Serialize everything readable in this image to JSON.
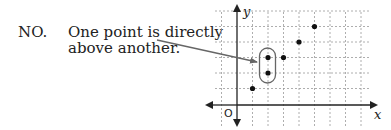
{
  "caption": {
    "label": "NO.",
    "line1": "One point is directly",
    "line2": "above another."
  },
  "axes": {
    "x_label": "x",
    "y_label": "y",
    "origin_label": "O"
  },
  "chart_data": {
    "type": "scatter",
    "title": "",
    "xlabel": "x",
    "ylabel": "y",
    "x": [
      1,
      2,
      2,
      3,
      4,
      5
    ],
    "y": [
      1,
      2,
      3,
      3,
      4,
      5
    ],
    "xlim": [
      -1,
      8
    ],
    "ylim": [
      -1,
      6
    ],
    "grid": true,
    "annotation": "Points (2,2) and (2,3) circled — one point is directly above another, so not a function."
  }
}
